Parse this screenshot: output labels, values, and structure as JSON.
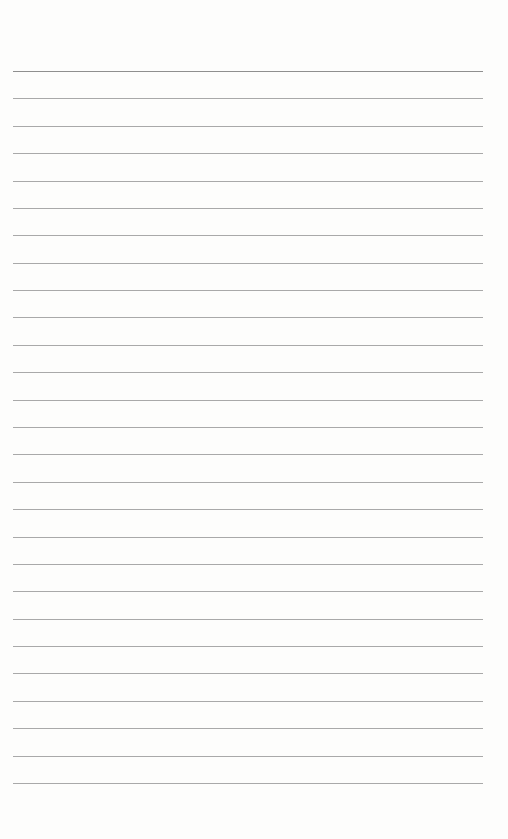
{
  "page": {
    "type": "lined-paper",
    "line_count": 27,
    "line_color": "#a9a9a9",
    "first_line_color": "#8f8f8f",
    "background_color": "#fdfdfc",
    "text": []
  }
}
